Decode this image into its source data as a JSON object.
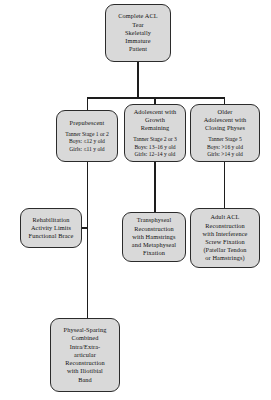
{
  "diagram": {
    "fill_color": "#d9d9d9",
    "line_color": "#1d1d1d",
    "nodes": {
      "root": {
        "title": [
          "Complete ACL",
          "Tear",
          "Skeletally",
          "Immature",
          "Patient"
        ],
        "criteria": []
      },
      "prepubescent": {
        "title": [
          "Prepubescent"
        ],
        "criteria": [
          "Tanner Stage 1 or 2",
          "Boys: ≤12 y old",
          "Girls: ≤11 y old"
        ]
      },
      "adolescent_growth": {
        "title": [
          "Adolescent with",
          "Growth",
          "Remaining"
        ],
        "criteria": [
          "Tanner Stage 2 or 3",
          "Boys: 13–16 y old",
          "Girls: 12–14 y old"
        ]
      },
      "older_adolescent": {
        "title": [
          "Older",
          "Adolescent with",
          "Closing Physes"
        ],
        "criteria": [
          "Tanner Stage 5",
          "Boys: >16 y old",
          "Girls: >14 y old"
        ]
      },
      "rehabilitation": {
        "title": [
          "Rehabilitation",
          "Activity Limits",
          "Functional Brace"
        ],
        "criteria": []
      },
      "transphyseal": {
        "title": [
          "Transphyseal",
          "Reconstruction",
          "with Hamstrings",
          "and Metaphyseal",
          "Fixation"
        ],
        "criteria": []
      },
      "adult_acl": {
        "title": [
          "Adult ACL",
          "Reconstruction",
          "with Interference",
          "Screw Fixation",
          "(Patellar Tendon",
          "or Hamstrings)"
        ],
        "criteria": []
      },
      "physeal_sparing": {
        "title": [
          "Physeal-Sparing",
          "Combined",
          "Intra/Extra-",
          "articular",
          "Reconstruction",
          "with Iliotibial",
          "Band"
        ],
        "criteria": []
      }
    }
  }
}
